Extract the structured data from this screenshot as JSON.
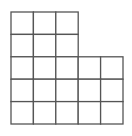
{
  "diagram": {
    "title": "",
    "type": "grid-shape",
    "stroke_color": "#555555",
    "background": "#ffffff",
    "origin": [
      11,
      12
    ],
    "cell_size": 22.4,
    "rows": [
      {
        "columns": 3
      },
      {
        "columns": 3
      },
      {
        "columns": 5
      },
      {
        "columns": 5
      },
      {
        "columns": 5
      }
    ],
    "total_cells": 21
  }
}
